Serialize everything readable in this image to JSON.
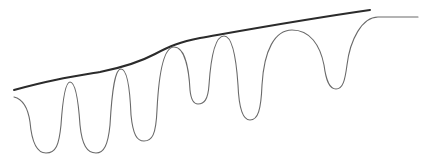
{
  "diagram": {
    "colors": {
      "envelope": "#2b2b2b",
      "wave": "#6a6a6a",
      "background": "#ffffff"
    },
    "curves": [
      {
        "name": "envelope-line",
        "style": "thick-dark"
      },
      {
        "name": "oscillating-wave",
        "style": "thin-gray"
      }
    ],
    "wave_features": {
      "peaks": 6,
      "troughs": 6,
      "ends_in": "flat plateau"
    },
    "labels": []
  }
}
